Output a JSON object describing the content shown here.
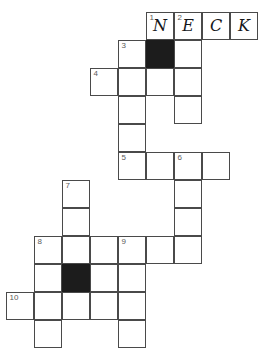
{
  "puzzle": {
    "title": "Crossword Grid",
    "cell_size": 28,
    "origin_x": 6,
    "origin_y": 12,
    "columns": 9,
    "rows": 12,
    "ink_color": "#4a4a4a",
    "block_color": "#1c1c1c",
    "number_color": "#5a5a5a",
    "letter_color": "#14161a",
    "background": "#ffffff",
    "cells": [
      {
        "name": "cell-r0c5",
        "col": 5,
        "row": 0,
        "number": "1",
        "letter": "N",
        "block": false
      },
      {
        "name": "cell-r0c6",
        "col": 6,
        "row": 0,
        "number": "2",
        "letter": "E",
        "block": false
      },
      {
        "name": "cell-r0c7",
        "col": 7,
        "row": 0,
        "number": "",
        "letter": "C",
        "block": false
      },
      {
        "name": "cell-r0c8",
        "col": 8,
        "row": 0,
        "number": "",
        "letter": "K",
        "block": false
      },
      {
        "name": "cell-r1c4",
        "col": 4,
        "row": 1,
        "number": "3",
        "letter": "",
        "block": false
      },
      {
        "name": "cell-r1c5",
        "col": 5,
        "row": 1,
        "number": "",
        "letter": "",
        "block": true
      },
      {
        "name": "cell-r1c6",
        "col": 6,
        "row": 1,
        "number": "",
        "letter": "",
        "block": false
      },
      {
        "name": "cell-r2c3",
        "col": 3,
        "row": 2,
        "number": "4",
        "letter": "",
        "block": false
      },
      {
        "name": "cell-r2c4",
        "col": 4,
        "row": 2,
        "number": "",
        "letter": "",
        "block": false
      },
      {
        "name": "cell-r2c5",
        "col": 5,
        "row": 2,
        "number": "",
        "letter": "",
        "block": false
      },
      {
        "name": "cell-r2c6",
        "col": 6,
        "row": 2,
        "number": "",
        "letter": "",
        "block": false
      },
      {
        "name": "cell-r3c4",
        "col": 4,
        "row": 3,
        "number": "",
        "letter": "",
        "block": false
      },
      {
        "name": "cell-r3c6",
        "col": 6,
        "row": 3,
        "number": "",
        "letter": "",
        "block": false
      },
      {
        "name": "cell-r4c4",
        "col": 4,
        "row": 4,
        "number": "",
        "letter": "",
        "block": false
      },
      {
        "name": "cell-r5c4",
        "col": 4,
        "row": 5,
        "number": "5",
        "letter": "",
        "block": false
      },
      {
        "name": "cell-r5c5",
        "col": 5,
        "row": 5,
        "number": "",
        "letter": "",
        "block": false
      },
      {
        "name": "cell-r5c6",
        "col": 6,
        "row": 5,
        "number": "6",
        "letter": "",
        "block": false
      },
      {
        "name": "cell-r5c7",
        "col": 7,
        "row": 5,
        "number": "",
        "letter": "",
        "block": false
      },
      {
        "name": "cell-r6c2",
        "col": 2,
        "row": 6,
        "number": "7",
        "letter": "",
        "block": false
      },
      {
        "name": "cell-r6c6",
        "col": 6,
        "row": 6,
        "number": "",
        "letter": "",
        "block": false
      },
      {
        "name": "cell-r7c2",
        "col": 2,
        "row": 7,
        "number": "",
        "letter": "",
        "block": false
      },
      {
        "name": "cell-r7c6",
        "col": 6,
        "row": 7,
        "number": "",
        "letter": "",
        "block": false
      },
      {
        "name": "cell-r8c1",
        "col": 1,
        "row": 8,
        "number": "8",
        "letter": "",
        "block": false
      },
      {
        "name": "cell-r8c2",
        "col": 2,
        "row": 8,
        "number": "",
        "letter": "",
        "block": false
      },
      {
        "name": "cell-r8c3",
        "col": 3,
        "row": 8,
        "number": "",
        "letter": "",
        "block": false
      },
      {
        "name": "cell-r8c4",
        "col": 4,
        "row": 8,
        "number": "9",
        "letter": "",
        "block": false
      },
      {
        "name": "cell-r8c5",
        "col": 5,
        "row": 8,
        "number": "",
        "letter": "",
        "block": false
      },
      {
        "name": "cell-r8c6",
        "col": 6,
        "row": 8,
        "number": "",
        "letter": "",
        "block": false
      },
      {
        "name": "cell-r9c1",
        "col": 1,
        "row": 9,
        "number": "",
        "letter": "",
        "block": false
      },
      {
        "name": "cell-r9c2",
        "col": 2,
        "row": 9,
        "number": "",
        "letter": "",
        "block": true
      },
      {
        "name": "cell-r9c3",
        "col": 3,
        "row": 9,
        "number": "",
        "letter": "",
        "block": false
      },
      {
        "name": "cell-r9c4",
        "col": 4,
        "row": 9,
        "number": "",
        "letter": "",
        "block": false
      },
      {
        "name": "cell-r10c0",
        "col": 0,
        "row": 10,
        "number": "10",
        "letter": "",
        "block": false
      },
      {
        "name": "cell-r10c1",
        "col": 1,
        "row": 10,
        "number": "",
        "letter": "",
        "block": false
      },
      {
        "name": "cell-r10c2",
        "col": 2,
        "row": 10,
        "number": "",
        "letter": "",
        "block": false
      },
      {
        "name": "cell-r10c3",
        "col": 3,
        "row": 10,
        "number": "",
        "letter": "",
        "block": false
      },
      {
        "name": "cell-r10c4",
        "col": 4,
        "row": 10,
        "number": "",
        "letter": "",
        "block": false
      },
      {
        "name": "cell-r11c1",
        "col": 1,
        "row": 11,
        "number": "",
        "letter": "",
        "block": false
      },
      {
        "name": "cell-r11c4",
        "col": 4,
        "row": 11,
        "number": "",
        "letter": "",
        "block": false
      }
    ]
  }
}
